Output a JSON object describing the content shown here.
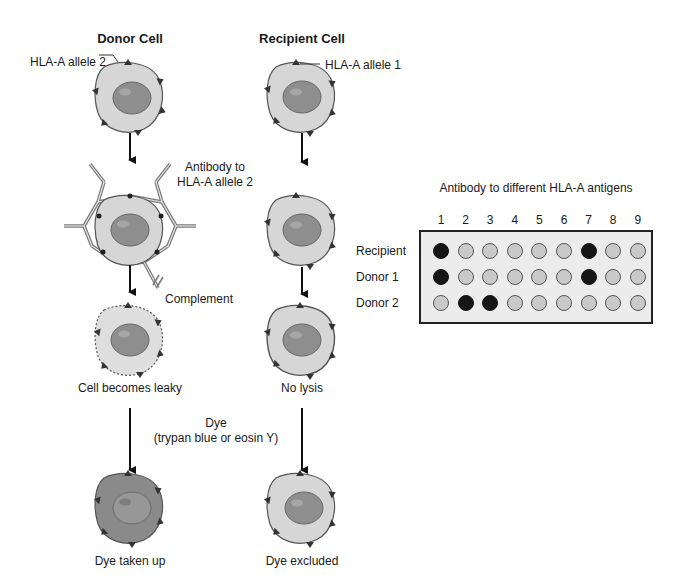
{
  "figure": {
    "left_column": {
      "title": "Donor Cell",
      "antigen_label": "HLA-A allele 2",
      "antibody_label_line1": "Antibody to",
      "antibody_label_line2": "HLA-A allele 2",
      "complement_label": "Complement",
      "after_complement_label": "Cell becomes leaky",
      "final_label": "Dye taken up"
    },
    "right_column": {
      "title": "Recipient Cell",
      "antigen_label": "HLA-A allele 1",
      "after_complement_label": "No lysis",
      "final_label": "Dye excluded"
    },
    "dye_label_line1": "Dye",
    "dye_label_line2": "(trypan blue or eosin Y)",
    "colors": {
      "cytoplasm": "#d6d6d6",
      "nucleus": "#8e8e8e",
      "dyed_cell": "#8a8a8a",
      "antigen": "#333333",
      "positive_well": "#161616",
      "negative_well": "#c9c9c9",
      "plate_background": "#ececec"
    }
  },
  "plate": {
    "title": "Antibody to different HLA-A antigens",
    "columns": [
      "1",
      "2",
      "3",
      "4",
      "5",
      "6",
      "7",
      "8",
      "9"
    ],
    "rows": [
      {
        "label": "Recipient",
        "positive": [
          1,
          7
        ]
      },
      {
        "label": "Donor 1",
        "positive": [
          1,
          7
        ]
      },
      {
        "label": "Donor 2",
        "positive": [
          2,
          3
        ]
      }
    ]
  },
  "chart_data": {
    "type": "table",
    "title": "Antibody to different HLA-A antigens",
    "columns": [
      "1",
      "2",
      "3",
      "4",
      "5",
      "6",
      "7",
      "8",
      "9"
    ],
    "rows": [
      "Recipient",
      "Donor 1",
      "Donor 2"
    ],
    "values": [
      [
        1,
        0,
        0,
        0,
        0,
        0,
        1,
        0,
        0
      ],
      [
        1,
        0,
        0,
        0,
        0,
        0,
        1,
        0,
        0
      ],
      [
        0,
        1,
        1,
        0,
        0,
        0,
        0,
        0,
        0
      ]
    ],
    "legend": {
      "1": "dark well (reaction / lysis)",
      "0": "light well (no reaction)"
    }
  }
}
